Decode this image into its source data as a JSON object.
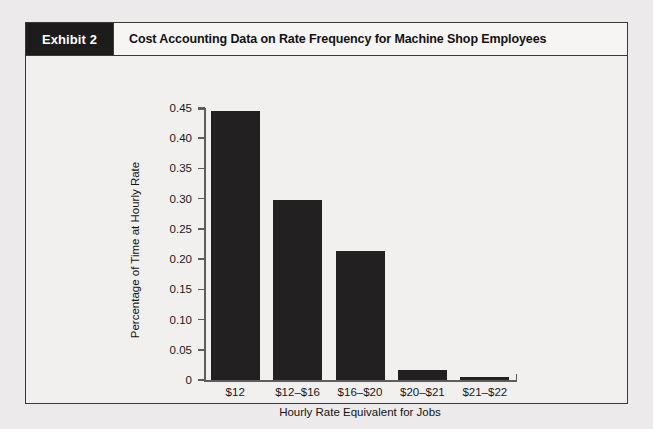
{
  "exhibit": {
    "tag": "Exhibit 2",
    "title": "Cost Accounting Data on Rate Frequency for Machine Shop Employees"
  },
  "colors": {
    "bar": "#222020",
    "tag_background": "#1c1c1c",
    "frame_border": "#3a3a3a",
    "page_background": "#eceaea",
    "panel_background": "#f1f0ef",
    "axis": "#5d5d5d"
  },
  "chart_data": {
    "type": "bar",
    "title": "Cost Accounting Data on Rate Frequency for Machine Shop Employees",
    "xlabel": "Hourly Rate Equivalent for Jobs",
    "ylabel": "Percentage of Time at Hourly Rate",
    "categories": [
      "$12",
      "$12–$16",
      "$16–$20",
      "$20–$21",
      "$21–$22"
    ],
    "values": [
      0.445,
      0.298,
      0.213,
      0.016,
      0.005
    ],
    "ylim": [
      0,
      0.45
    ],
    "yticks": [
      0,
      0.05,
      0.1,
      0.15,
      0.2,
      0.25,
      0.3,
      0.35,
      0.4,
      0.45
    ],
    "ytick_labels": [
      "0",
      "0.05",
      "0.10",
      "0.15",
      "0.20",
      "0.25",
      "0.30",
      "0.35",
      "0.40",
      "0.45"
    ],
    "grid": false,
    "legend": null
  }
}
